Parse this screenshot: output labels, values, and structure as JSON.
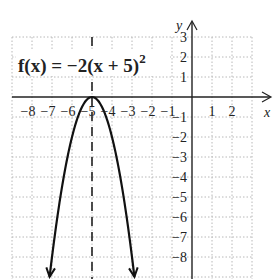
{
  "chart_data": {
    "type": "line",
    "function": {
      "name": "f(x)",
      "a": -2,
      "h": -5,
      "k": 0
    },
    "vertex": [
      -5,
      0
    ],
    "axis_of_symmetry": "x = -5",
    "xlabel": "x",
    "ylabel": "y",
    "xlim": [
      -9,
      3
    ],
    "ylim": [
      -9,
      3
    ],
    "grid": true,
    "x_ticks": [
      "−8",
      "−7",
      "−6",
      "−5",
      "−4",
      "−3",
      "−2",
      "−1",
      "1",
      "2"
    ],
    "y_ticks": [
      "3",
      "2",
      "1",
      "−1",
      "−2",
      "−3",
      "−4",
      "−5",
      "−6",
      "−7",
      "−8"
    ],
    "series": [
      {
        "name": "f(x) = −2(x + 5)²",
        "x": [
          -7.1,
          -6.5,
          -6,
          -5.5,
          -5,
          -4.5,
          -4,
          -3.5,
          -2.9
        ],
        "y": [
          -8.82,
          -4.5,
          -2,
          -0.5,
          0,
          -0.5,
          -2,
          -4.5,
          -8.82
        ]
      }
    ]
  },
  "labels": {
    "fn_lhs": "f(x) = −2(x + 5)",
    "fn_exp": "2",
    "x_axis": "x",
    "y_axis": "y"
  }
}
